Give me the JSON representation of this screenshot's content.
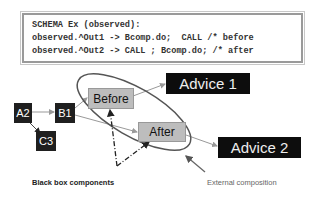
{
  "schema_box": {
    "lines": [
      "SCHEMA Ex (observed):",
      "observed.^Out1 -> Bcomp.do;  CALL /* before",
      "observed.^Out2 -> CALL ; Bcomp.do; /* after"
    ]
  },
  "nodes": {
    "a2": "A2",
    "b1": "B1",
    "c3": "C3",
    "before": "Before",
    "after": "After",
    "advice1": "Advice 1",
    "advice2": "Advice 2"
  },
  "labels": {
    "black_box": "Black box components",
    "external": "External composition"
  },
  "colors": {
    "dark_node": "#1f1f1f",
    "gray_node": "#bdbdbd",
    "ellipse": "#555555",
    "arrow": "#9a9a9a"
  }
}
